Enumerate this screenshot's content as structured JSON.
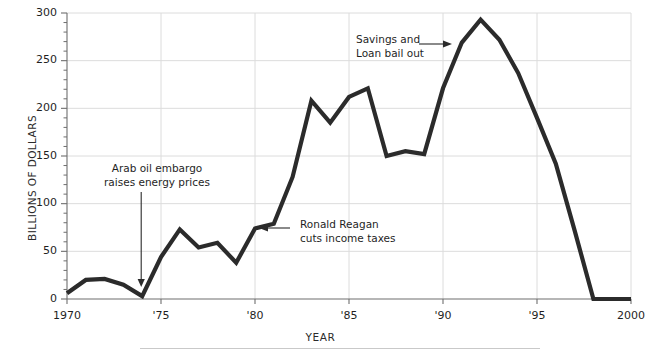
{
  "chart_data": {
    "type": "line",
    "title": "",
    "xlabel": "YEAR",
    "ylabel": "BILLIONS OF DOLLARS",
    "xlim": [
      1970,
      2000
    ],
    "ylim": [
      0,
      300
    ],
    "grid": true,
    "legend": "none",
    "x_tick_labels": [
      "1970",
      "'75",
      "'80",
      "'85",
      "'90",
      "'95",
      "2000"
    ],
    "x_tick_values": [
      1970,
      1975,
      1980,
      1985,
      1990,
      1995,
      2000
    ],
    "y_tick_labels": [
      "0",
      "50",
      "100",
      "150",
      "200",
      "250",
      "300"
    ],
    "y_tick_values": [
      0,
      50,
      100,
      150,
      200,
      250,
      300
    ],
    "y_minor_tick_step": 10,
    "series": [
      {
        "name": "Federal budget deficit",
        "color": "#2b2b2b",
        "x": [
          1970,
          1971,
          1972,
          1973,
          1974,
          1975,
          1976,
          1977,
          1978,
          1979,
          1980,
          1981,
          1982,
          1983,
          1984,
          1985,
          1986,
          1987,
          1988,
          1989,
          1990,
          1991,
          1992,
          1993,
          1994,
          1995,
          1996,
          1997,
          1998,
          1999,
          2000
        ],
        "values": [
          6,
          20,
          21,
          15,
          3,
          44,
          73,
          54,
          59,
          38,
          74,
          79,
          128,
          208,
          185,
          212,
          221,
          150,
          155,
          152,
          221,
          269,
          293,
          272,
          237,
          190,
          142,
          72,
          0,
          0,
          0
        ]
      }
    ],
    "annotations": [
      {
        "id": "arab-oil-embargo",
        "lines": [
          "Arab oil embargo",
          "raises energy prices"
        ],
        "arrow": "down",
        "points_to_year": 1974,
        "points_to_value": 3
      },
      {
        "id": "ronald-reagan-tax-cuts",
        "lines": [
          "Ronald Reagan",
          "cuts income taxes"
        ],
        "arrow": "left",
        "points_to_year": 1981,
        "points_to_value": 79
      },
      {
        "id": "savings-and-loan-bailout",
        "lines": [
          "Savings and",
          "Loan bail out"
        ],
        "arrow": "right",
        "points_to_year": 1991,
        "points_to_value": 269
      }
    ],
    "colors": {
      "line": "#2b2b2b",
      "grid": "#dcdcdc",
      "axis": "#6e6e6e",
      "text": "#1f1f1f",
      "background": "#ffffff"
    }
  }
}
